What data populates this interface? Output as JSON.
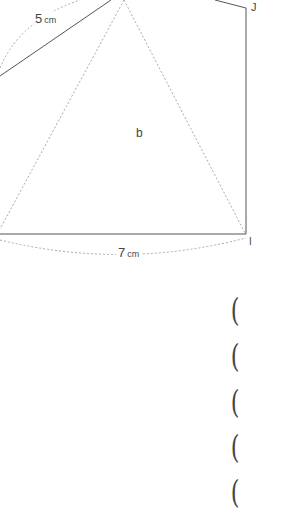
{
  "figure": {
    "side_top_left": {
      "value": "5",
      "unit": "cm"
    },
    "side_bottom": {
      "value": "7",
      "unit": "cm"
    },
    "center_label": "b",
    "vertex_top_right": "J",
    "vertex_bottom_right": "I"
  },
  "answer_blanks": [
    {
      "open": "("
    },
    {
      "open": "("
    },
    {
      "open": "("
    },
    {
      "open": "("
    },
    {
      "open": "("
    }
  ],
  "colors": {
    "solid_line": "#555555",
    "dotted_line": "#aaaaaa"
  }
}
